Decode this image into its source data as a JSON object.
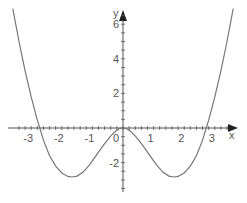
{
  "chart_data": {
    "type": "line",
    "title": "",
    "xlabel": "x",
    "ylabel": "y",
    "xlim": [
      -3.6,
      3.6
    ],
    "ylim": [
      -3.5,
      7
    ],
    "grid": false,
    "legend": null,
    "x_ticks": [
      -3,
      -2,
      -1,
      0,
      1,
      2,
      3
    ],
    "x_tick_labels": [
      "-3",
      "-2",
      "-1",
      "0",
      "1",
      "2",
      "3"
    ],
    "y_ticks": [
      -2,
      2,
      4,
      6
    ],
    "y_tick_labels": [
      "-2",
      "2",
      "4",
      "6"
    ],
    "series": [
      {
        "name": "f(x)",
        "color": "#777777",
        "x": [
          -3.6,
          -3.4,
          -3.2,
          -3.0,
          -2.8,
          -2.72,
          -2.6,
          -2.4,
          -2.2,
          -2.0,
          -1.8,
          -1.67,
          -1.5,
          -1.3,
          -1.1,
          -1.0,
          -0.8,
          -0.6,
          -0.4,
          -0.2,
          -0.1,
          0,
          0.1,
          0.2,
          0.4,
          0.6,
          0.8,
          1.0,
          1.1,
          1.3,
          1.5,
          1.67,
          1.8,
          2.0,
          2.2,
          2.4,
          2.6,
          2.72,
          2.8,
          3.0,
          3.2,
          3.4,
          3.6
        ],
        "y": [
          6.9,
          5.0,
          3.3,
          1.8,
          0.45,
          0.0,
          -0.7,
          -1.6,
          -2.2,
          -2.6,
          -2.8,
          -2.83,
          -2.78,
          -2.55,
          -2.15,
          -1.9,
          -1.4,
          -0.9,
          -0.45,
          -0.12,
          -0.03,
          0.0,
          -0.03,
          -0.12,
          -0.45,
          -0.9,
          -1.4,
          -1.9,
          -2.15,
          -2.55,
          -2.78,
          -2.83,
          -2.8,
          -2.6,
          -2.2,
          -1.6,
          -0.7,
          0.0,
          0.45,
          1.8,
          3.3,
          5.0,
          6.9
        ]
      }
    ]
  },
  "colors": {
    "axis": "#555555",
    "curve": "#777777"
  }
}
